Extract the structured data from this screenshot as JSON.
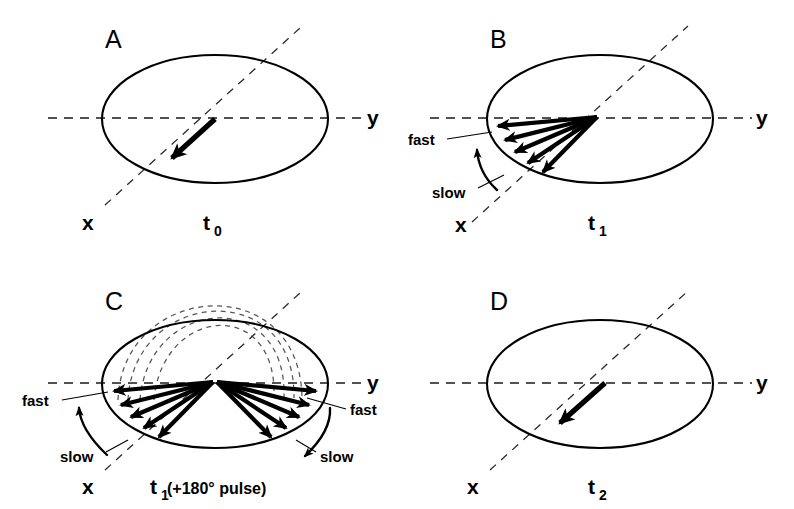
{
  "figure": {
    "background_color": "#ffffff",
    "ink_color": "#000000",
    "dashed_color": "#555555",
    "width": 794,
    "height": 509
  },
  "panels": [
    {
      "id": "A",
      "letter": "A",
      "time_label": "t",
      "time_subscript": "0",
      "axis_x_label": "x",
      "axis_y_label": "y",
      "vector_count": 1,
      "description": "single net magnetization vector along -x",
      "rate_labels": []
    },
    {
      "id": "B",
      "letter": "B",
      "time_label": "t",
      "time_subscript": "1",
      "axis_x_label": "x",
      "axis_y_label": "y",
      "vector_count": 5,
      "description": "dephasing fan of isochromats spreading between fast and slow",
      "rate_labels": [
        {
          "text": "fast",
          "side": "left-upper"
        },
        {
          "text": "slow",
          "side": "left-lower"
        }
      ]
    },
    {
      "id": "C",
      "letter": "C",
      "time_label": "t",
      "time_subscript": "1",
      "time_suffix": " (+180° pulse)",
      "axis_x_label": "x",
      "axis_y_label": "y",
      "vector_count": 10,
      "trajectory_arc_count": 4,
      "description": "after 180 degree pulse the fan is mirrored; dashed arcs show flip trajectories",
      "rate_labels": [
        {
          "text": "fast",
          "side": "left-upper"
        },
        {
          "text": "slow",
          "side": "left-lower"
        },
        {
          "text": "fast",
          "side": "right-upper"
        },
        {
          "text": "slow",
          "side": "right-lower"
        }
      ]
    },
    {
      "id": "D",
      "letter": "D",
      "time_label": "t",
      "time_subscript": "2",
      "axis_x_label": "x",
      "axis_y_label": "y",
      "vector_count": 1,
      "description": "refocused echo: vectors recombine into one net vector along -x",
      "rate_labels": []
    }
  ],
  "pulse_caption": {
    "prefix": "t",
    "subscript": "1",
    "suffix": " (+180° pulse)"
  },
  "labels": {
    "fast": "fast",
    "slow": "slow",
    "axis_x": "x",
    "axis_y": "y"
  }
}
